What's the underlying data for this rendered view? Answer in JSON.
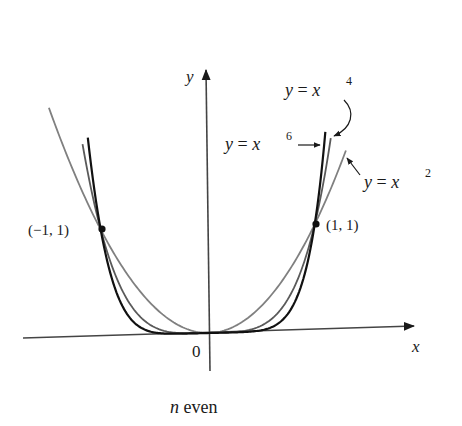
{
  "chart_data": {
    "type": "line",
    "title": "",
    "caption": "n even",
    "caption_var": "n",
    "caption_rest": " even",
    "xlabel": "x",
    "ylabel": "y",
    "origin_label": "0",
    "xlim": [
      -1.35,
      1.35
    ],
    "ylim": [
      0,
      2.6
    ],
    "grid": false,
    "legend": "inline annotations with arrows",
    "series": [
      {
        "name": "y = x^2",
        "label_base": "y = x",
        "exponent": "2",
        "exp": 2,
        "color": "#808080",
        "x_range": [
          -1.47,
          1.3
        ]
      },
      {
        "name": "y = x^4",
        "label_base": "y = x",
        "exponent": "4",
        "exp": 4,
        "color": "#5a5a5a",
        "x_range": [
          -1.16,
          1.16
        ]
      },
      {
        "name": "y = x^6",
        "label_base": "y = x",
        "exponent": "6",
        "exp": 6,
        "color": "#111111",
        "x_range": [
          -1.11,
          1.11
        ]
      }
    ],
    "points": [
      {
        "label": "(−1, 1)",
        "x": -1,
        "y": 1
      },
      {
        "label": "(1, 1)",
        "x": 1,
        "y": 1
      }
    ]
  }
}
